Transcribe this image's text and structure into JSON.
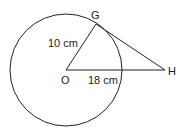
{
  "diagram": {
    "points": {
      "center": {
        "label": "O"
      },
      "tangent_point": {
        "label": "G"
      },
      "external_point": {
        "label": "H"
      }
    },
    "segments": {
      "radius_OG": {
        "length_label": "10 cm"
      },
      "segment_OH": {
        "length_label": "18 cm"
      }
    },
    "colors": {
      "stroke": "#222222",
      "background": "#ffffff"
    }
  }
}
